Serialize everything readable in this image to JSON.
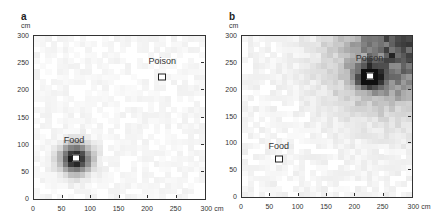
{
  "panels": [
    {
      "label": "a",
      "y_unit": "cm",
      "x_unit": "cm",
      "box": {
        "left": 33,
        "top": 35,
        "width": 171,
        "height": 163
      },
      "x_ticks": [
        "0",
        "50",
        "100",
        "150",
        "200",
        "250",
        "300 cm"
      ],
      "y_ticks": [
        "0",
        "50",
        "100",
        "150",
        "200",
        "250",
        "300"
      ],
      "annotations": [
        {
          "text": "Food",
          "x": 70,
          "y": 100,
          "marker_x": 73,
          "marker_y": 75
        },
        {
          "text": "Poison",
          "x": 225,
          "y": 245,
          "marker_x": 225,
          "marker_y": 225
        }
      ]
    },
    {
      "label": "b",
      "y_unit": "cm",
      "x_unit": "cm",
      "box": {
        "left": 241,
        "top": 35,
        "width": 170,
        "height": 161
      },
      "x_ticks": [
        "0",
        "50",
        "100",
        "150",
        "200",
        "250",
        "300 cm"
      ],
      "y_ticks": [
        "0",
        "50",
        "100",
        "150",
        "200",
        "250",
        "300"
      ],
      "annotations": [
        {
          "text": "Food",
          "x": 65,
          "y": 85,
          "marker_x": 65,
          "marker_y": 70
        },
        {
          "text": "Poison",
          "x": 225,
          "y": 250,
          "marker_x": 225,
          "marker_y": 225
        }
      ]
    }
  ],
  "chart_data": [
    {
      "type": "heatmap",
      "title": "a",
      "xlabel": "cm",
      "ylabel": "cm",
      "xlim": [
        0,
        300
      ],
      "ylim": [
        0,
        300
      ],
      "hotspots": [
        {
          "x": 73,
          "y": 75,
          "intensity": 1.0,
          "spread": 18,
          "label": "Food"
        }
      ],
      "background": 0.04
    },
    {
      "type": "heatmap",
      "title": "b",
      "xlabel": "cm",
      "ylabel": "cm",
      "xlim": [
        0,
        300
      ],
      "ylim": [
        0,
        300
      ],
      "hotspots": [
        {
          "x": 225,
          "y": 225,
          "intensity": 1.0,
          "spread": 15,
          "label": "Poison"
        },
        {
          "x": 260,
          "y": 260,
          "intensity": 0.45,
          "spread": 70
        },
        {
          "x": 300,
          "y": 300,
          "intensity": 0.4,
          "spread": 60
        }
      ],
      "background": 0.05
    }
  ]
}
